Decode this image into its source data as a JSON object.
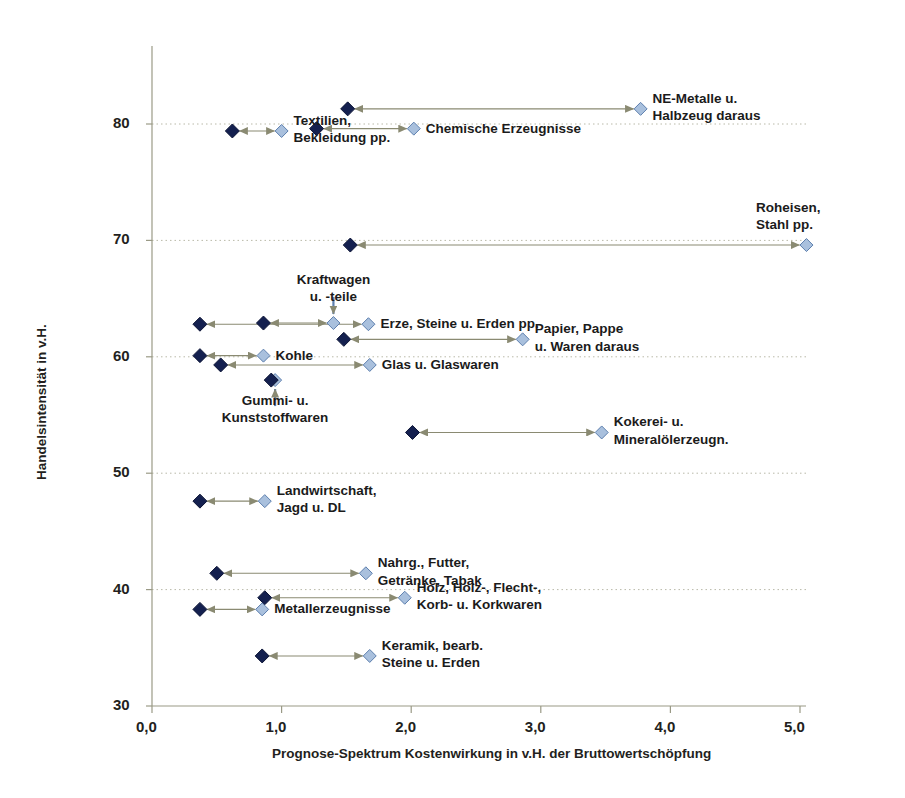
{
  "chart_data": {
    "type": "scatter",
    "title": "",
    "xlabel": "Prognose-Spektrum Kostenwirkung in v.H. der Bruttowertschöpfung",
    "ylabel": "Handelsintensität in v.H.",
    "xlim": [
      0.0,
      5.4
    ],
    "ylim": [
      30,
      85
    ],
    "xticks": [
      "0,0",
      "1,0",
      "2,0",
      "3,0",
      "4,0",
      "5,0"
    ],
    "xtick_values": [
      0.0,
      1.0,
      2.0,
      3.0,
      4.0,
      5.0
    ],
    "yticks": [
      "30",
      "40",
      "50",
      "60",
      "70",
      "80"
    ],
    "ytick_values": [
      30,
      40,
      50,
      60,
      70,
      80
    ],
    "grid": "horizontal-dotted",
    "legend": "none",
    "marker_dark_color": "#14204f",
    "marker_light_color": "#a9c0dd",
    "arrow_color": "#8a8a72",
    "note": "Each sector is a horizontal range: a dark diamond at the low-cost end and a light diamond at the high-cost end, joined by a double-headed arrow at the same trade-intensity value.",
    "points": [
      {
        "label": "NE-Metalle u.\nHalbzeug daraus",
        "label_lines": [
          "NE-Metalle u.",
          "Halbzeug daraus"
        ],
        "y": 81.3,
        "x_dark": 1.51,
        "x_light": 3.77,
        "label_align": "left"
      },
      {
        "label": "Chemische Erzeugnisse",
        "label_lines": [
          "Chemische Erzeugnisse"
        ],
        "y": 79.6,
        "x_dark": 1.27,
        "x_light": 2.02,
        "label_align": "left"
      },
      {
        "label": "Textilien,\nBekleidung pp.",
        "label_lines": [
          "Textilien,",
          "Bekleidung pp."
        ],
        "y": 79.4,
        "x_dark": 0.62,
        "x_light": 1.0,
        "label_align": "left"
      },
      {
        "label": "Roheisen,\nStahl pp.",
        "label_lines": [
          "Roheisen,",
          "Stahl pp."
        ],
        "y": 69.6,
        "x_dark": 1.53,
        "x_light": 5.05,
        "label_align": "right"
      },
      {
        "label": "Erze, Steine u. Erden pp.",
        "label_lines": [
          "Erze, Steine u. Erden pp."
        ],
        "y": 62.8,
        "x_dark": 0.37,
        "x_light": 1.67,
        "label_align": "left"
      },
      {
        "label": "Kraftwagen\nu. -teile",
        "label_lines": [
          "Kraftwagen",
          "u. -teile"
        ],
        "y": 62.9,
        "x_dark": 0.86,
        "x_light": 1.4,
        "label_align": "center"
      },
      {
        "label": "Papier, Pappe\nu. Waren daraus",
        "label_lines": [
          "Papier, Pappe",
          "u. Waren daraus"
        ],
        "y": 61.5,
        "x_dark": 1.48,
        "x_light": 2.86,
        "label_align": "left"
      },
      {
        "label": "Kohle",
        "label_lines": [
          "Kohle"
        ],
        "y": 60.1,
        "x_dark": 0.37,
        "x_light": 0.86,
        "label_align": "left"
      },
      {
        "label": "Glas u. Glaswaren",
        "label_lines": [
          "Glas u. Glaswaren"
        ],
        "y": 59.3,
        "x_dark": 0.53,
        "x_light": 1.68,
        "label_align": "left"
      },
      {
        "label": "Gummi- u.\nKunststoffwaren",
        "label_lines": [
          "Gummi- u.",
          "Kunststoffwaren"
        ],
        "y": 58.0,
        "x_dark": 0.92,
        "x_light": 0.95,
        "label_align": "center"
      },
      {
        "label": "Kokerei- u.\nMineralölerzeugn.",
        "label_lines": [
          "Kokerei- u.",
          "Mineralölerzeugn."
        ],
        "y": 53.5,
        "x_dark": 2.01,
        "x_light": 3.47,
        "label_align": "left"
      },
      {
        "label": "Landwirtschaft,\nJagd u. DL",
        "label_lines": [
          "Landwirtschaft,",
          "Jagd u. DL"
        ],
        "y": 47.6,
        "x_dark": 0.37,
        "x_light": 0.87,
        "label_align": "left"
      },
      {
        "label": "Nahrg., Futter,\nGetränke, Tabak",
        "label_lines": [
          "Nahrg., Futter,",
          "Getränke, Tabak"
        ],
        "y": 41.4,
        "x_dark": 0.5,
        "x_light": 1.65,
        "label_align": "left"
      },
      {
        "label": "Holz, Holz-, Flecht-,\nKorb- u. Korkwaren",
        "label_lines": [
          "Holz, Holz-, Flecht-,",
          "Korb- u. Korkwaren"
        ],
        "y": 39.3,
        "x_dark": 0.87,
        "x_light": 1.95,
        "label_align": "left"
      },
      {
        "label": "Metallerzeugnisse",
        "label_lines": [
          "Metallerzeugnisse"
        ],
        "y": 38.3,
        "x_dark": 0.37,
        "x_light": 0.85,
        "label_align": "left"
      },
      {
        "label": "Keramik, bearb.\nSteine u. Erden",
        "label_lines": [
          "Keramik, bearb.",
          "Steine u. Erden"
        ],
        "y": 34.3,
        "x_dark": 0.85,
        "x_light": 1.68,
        "label_align": "left"
      }
    ]
  }
}
